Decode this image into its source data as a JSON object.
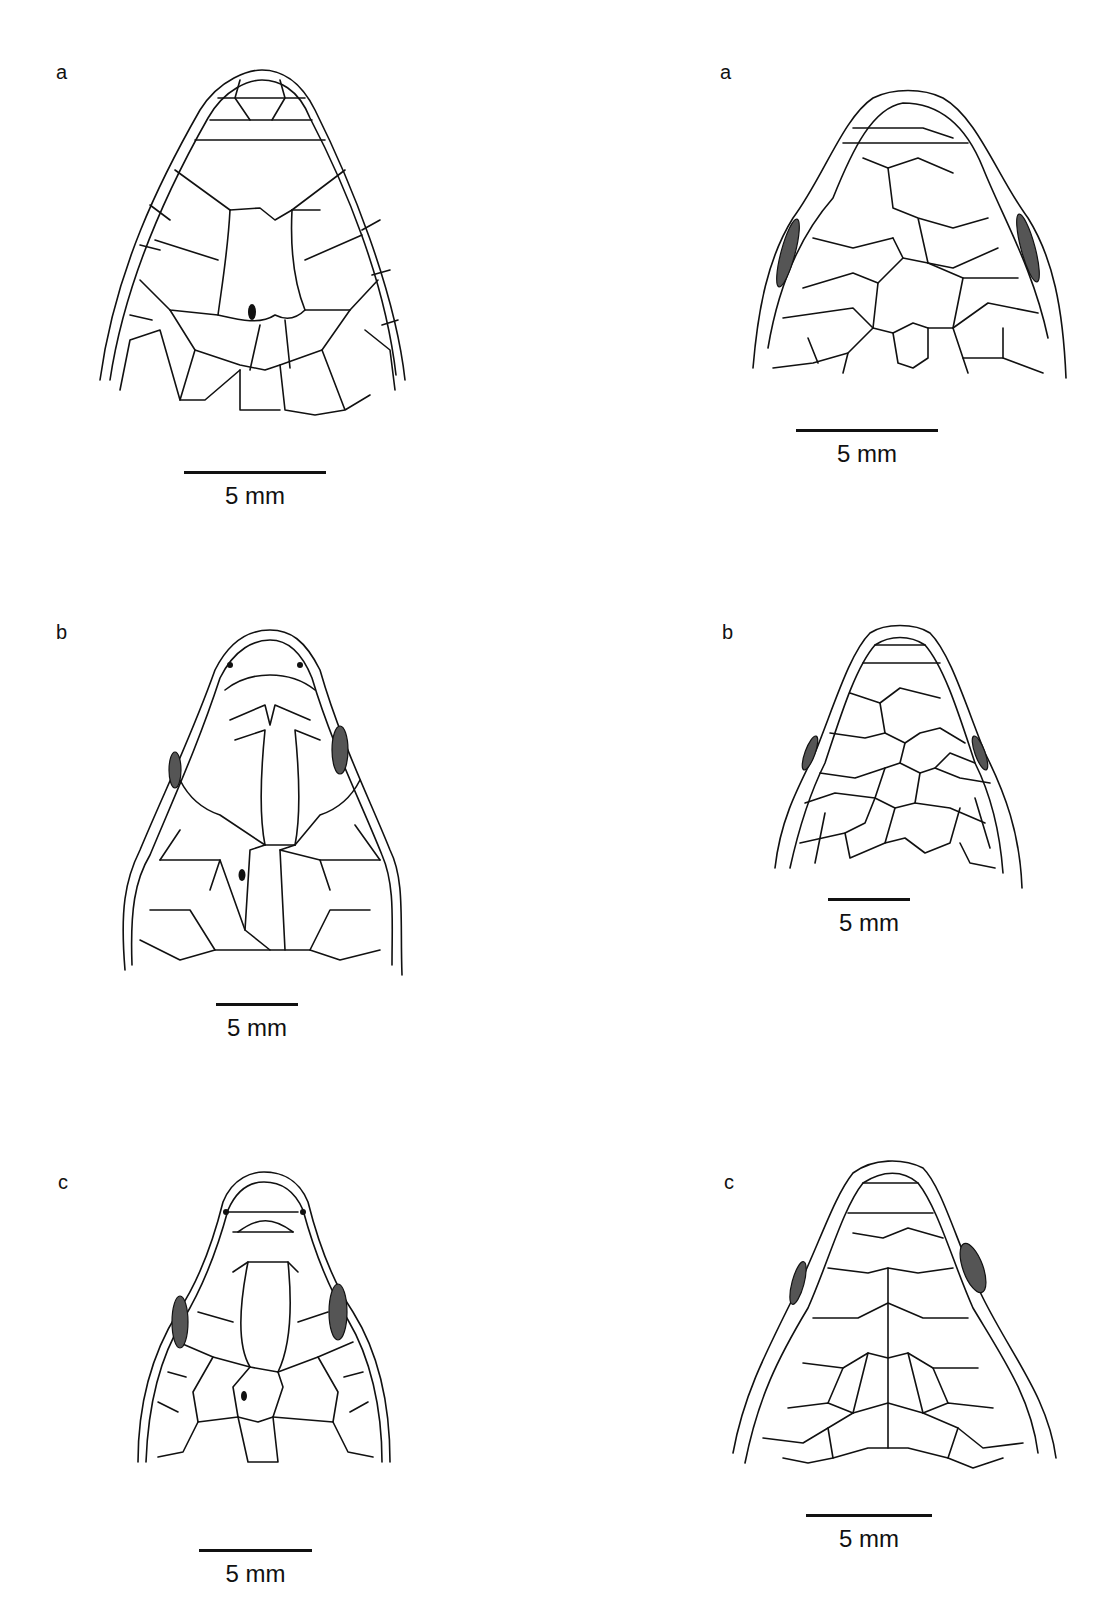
{
  "figure": {
    "left_column": [
      {
        "label": "a",
        "scale": "5 mm",
        "has_parietal_eye": true
      },
      {
        "label": "b",
        "scale": "5 mm",
        "has_parietal_eye": true
      },
      {
        "label": "c",
        "scale": "5 mm",
        "has_parietal_eye": true
      }
    ],
    "right_column": [
      {
        "label": "a",
        "scale": "5 mm",
        "has_parietal_eye": false
      },
      {
        "label": "b",
        "scale": "5 mm",
        "has_parietal_eye": false
      },
      {
        "label": "c",
        "scale": "5 mm",
        "has_parietal_eye": false
      }
    ],
    "colors": {
      "ink": "#111111",
      "background": "#ffffff"
    }
  }
}
